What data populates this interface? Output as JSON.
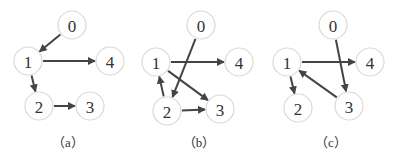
{
  "graphs": [
    {
      "caption": "（a）",
      "caption_pos": [
        68,
        147
      ],
      "nodes": [
        {
          "id": "0",
          "x": 72,
          "y": 25
        },
        {
          "id": "1",
          "x": 28,
          "y": 61
        },
        {
          "id": "4",
          "x": 110,
          "y": 61
        },
        {
          "id": "2",
          "x": 39,
          "y": 106
        },
        {
          "id": "3",
          "x": 90,
          "y": 106
        }
      ],
      "edges": [
        [
          "0",
          "1"
        ],
        [
          "1",
          "4"
        ],
        [
          "1",
          "2"
        ],
        [
          "2",
          "3"
        ]
      ]
    },
    {
      "caption": "（b）",
      "caption_pos": [
        199,
        147
      ],
      "nodes": [
        {
          "id": "0",
          "x": 201,
          "y": 25
        },
        {
          "id": "1",
          "x": 156,
          "y": 62
        },
        {
          "id": "4",
          "x": 239,
          "y": 62
        },
        {
          "id": "2",
          "x": 167,
          "y": 111
        },
        {
          "id": "3",
          "x": 220,
          "y": 109
        }
      ],
      "edges": [
        [
          "0",
          "2"
        ],
        [
          "1",
          "4"
        ],
        [
          "1",
          "3"
        ],
        [
          "2",
          "1"
        ],
        [
          "2",
          "3"
        ]
      ]
    },
    {
      "caption": "（c）",
      "caption_pos": [
        331,
        147
      ],
      "nodes": [
        {
          "id": "0",
          "x": 333,
          "y": 25
        },
        {
          "id": "1",
          "x": 287,
          "y": 62
        },
        {
          "id": "4",
          "x": 370,
          "y": 62
        },
        {
          "id": "2",
          "x": 298,
          "y": 108
        },
        {
          "id": "3",
          "x": 349,
          "y": 106
        }
      ],
      "edges": [
        [
          "0",
          "3"
        ],
        [
          "1",
          "4"
        ],
        [
          "1",
          "2"
        ],
        [
          "3",
          "1"
        ]
      ]
    }
  ],
  "style": {
    "node_radius": 14,
    "node_stroke": "#d9d9d9",
    "edge_color": "#444444"
  }
}
